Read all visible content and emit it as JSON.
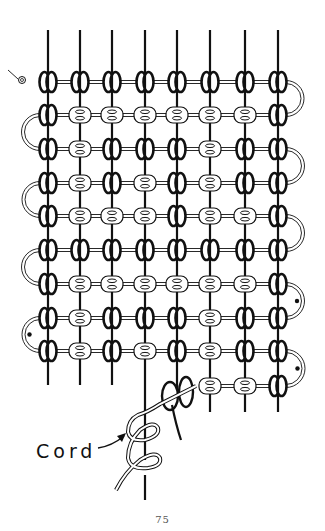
{
  "page": {
    "number": "75",
    "label": "Cord"
  },
  "illustration": {
    "subject": "macrame-knot-grid",
    "columns": 8,
    "knot_legend": {
      "B": "vertical-knot (dark)",
      "W": "horizontal-knot (light)"
    },
    "rows": [
      "BBBBBBBB",
      "BWWWWWWB",
      "BWBBBWBB",
      "BWBWBWBB",
      "BWWWBWWB",
      "BBBBBBBB",
      "BWWWWWWB",
      "BWBBBWBB",
      "BWBWBWBB"
    ],
    "partial_row": "_____WWB",
    "colors": {
      "ink": "#111111",
      "paper": "#ffffff"
    }
  }
}
